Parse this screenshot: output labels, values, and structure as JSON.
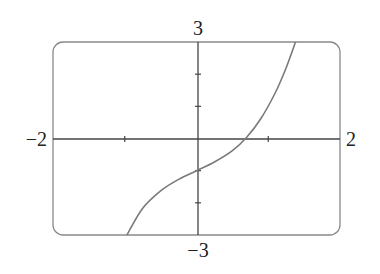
{
  "chart_data": {
    "type": "line",
    "title": "",
    "xlabel": "",
    "ylabel": "",
    "xlim": [
      -2,
      2
    ],
    "ylim": [
      -3,
      3
    ],
    "grid": false,
    "legend": null,
    "axis_labels": {
      "x_min": "−2",
      "x_max": "2",
      "y_min": "−3",
      "y_max": "3"
    },
    "x_ticks": [
      -1,
      1
    ],
    "y_ticks": [
      -2,
      -1,
      1,
      2
    ],
    "series": [
      {
        "name": "curve",
        "x": [
          -0.97,
          -0.75,
          -0.5,
          -0.25,
          0,
          0.25,
          0.5,
          0.7,
          0.9,
          1.1,
          1.25,
          1.38
        ],
        "y": [
          -3.0,
          -2.17,
          -1.63,
          -1.27,
          -1.0,
          -0.73,
          -0.38,
          0.04,
          0.63,
          1.43,
          2.2,
          3.0
        ]
      }
    ],
    "colors": {
      "curve": "#7a7a7a",
      "axes": "#444444",
      "frame": "#8a8a8a"
    }
  }
}
